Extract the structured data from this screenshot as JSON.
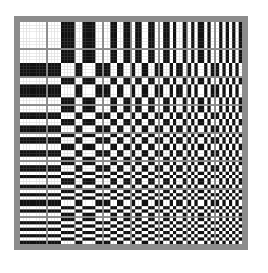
{
  "figure": {
    "order": "sequency",
    "size": 8,
    "frame_color": "#8c8c8c",
    "black": "#111111",
    "white": "#ffffff",
    "cell_size": 26,
    "gap": 2
  }
}
